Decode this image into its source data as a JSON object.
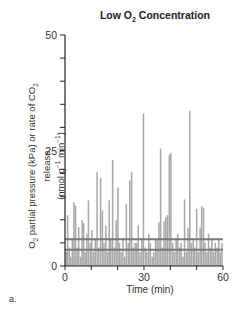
{
  "chart_data": {
    "type": "bar",
    "title": "Low O2 Concentration",
    "title_parts": {
      "pre": "Low O",
      "sub": "2",
      "post": " Concentration"
    },
    "xlabel": "Time (min)",
    "ylabel": "O2 partial pressure (kPa) or rate of CO2 release (nmol g-1 min-1)",
    "ylabel_parts": {
      "line1_pre": "O",
      "line1_sub1": "2",
      "line1_mid": " partial pressure (kPa) or rate of CO",
      "line1_sub2": "2",
      "line1_post": " release",
      "line2_pre": "(nmol g",
      "line2_sup1": "−1",
      "line2_mid": " min",
      "line2_sup2": "−1",
      "line2_post": ")"
    },
    "xlim": [
      0,
      60
    ],
    "ylim": [
      0,
      50
    ],
    "xticks_labeled": [
      0,
      30,
      60
    ],
    "xticks_minor": [
      10,
      20,
      40,
      50
    ],
    "yticks_labeled": [
      0,
      25,
      50
    ],
    "yticks_minor": [
      5,
      10,
      15,
      20,
      30,
      35,
      40,
      45
    ],
    "grid": false,
    "panel_label": "a.",
    "series": [
      {
        "name": "CO2 release rate",
        "color": "#a9a9a9",
        "x": [
          0.5,
          1.0,
          1.6,
          2.2,
          2.8,
          3.4,
          4.0,
          4.6,
          5.2,
          5.9,
          6.5,
          7.1,
          7.7,
          8.3,
          8.9,
          9.6,
          10.2,
          10.9,
          11.5,
          12.2,
          12.8,
          13.5,
          14.2,
          14.8,
          15.5,
          16.2,
          16.8,
          17.4,
          18.1,
          18.8,
          19.4,
          20.1,
          20.7,
          21.3,
          22.0,
          22.7,
          23.3,
          24.0,
          24.6,
          25.3,
          25.9,
          26.6,
          27.2,
          27.8,
          28.5,
          29.2,
          29.8,
          30.5,
          31.1,
          31.8,
          32.4,
          33.1,
          33.7,
          34.4,
          35.0,
          35.7,
          36.3,
          37.0,
          37.6,
          38.3,
          38.9,
          39.6,
          40.2,
          40.9,
          41.5,
          42.2,
          42.8,
          43.5,
          44.1,
          44.8,
          45.4,
          46.1,
          46.7,
          47.4,
          48.0,
          48.7,
          49.3,
          50.0,
          50.6,
          51.3,
          51.9,
          52.6,
          53.2,
          53.9,
          54.5,
          55.2,
          55.8,
          56.5,
          57.1,
          57.8,
          58.4,
          59.0,
          59.6
        ],
        "values": [
          3,
          11,
          4,
          2,
          6,
          13.8,
          13.1,
          4,
          8.4,
          2,
          9.9,
          9.3,
          3,
          7,
          14.2,
          5,
          7.8,
          3,
          6,
          20.3,
          4,
          19,
          12,
          5,
          8.8,
          3,
          14.2,
          6,
          23,
          4,
          9.9,
          17,
          5,
          3,
          6,
          2,
          13.4,
          5,
          18.5,
          20.3,
          4,
          5,
          5,
          8.8,
          3,
          6,
          33,
          4,
          3,
          7,
          5,
          2,
          3,
          6,
          5.6,
          9.5,
          25.4,
          4,
          9.7,
          10.5,
          11,
          24.1,
          24.5,
          5,
          3,
          6,
          7,
          4,
          5,
          2,
          14.4,
          3,
          8.2,
          33.6,
          5,
          6,
          4,
          12.4,
          3,
          8.3,
          12.9,
          12.6,
          5,
          3,
          7,
          4,
          6,
          3,
          5,
          4,
          6,
          3,
          5
        ]
      },
      {
        "name": "O2 partial pressure (upper line)",
        "color": "#7a7a7a",
        "type": "line",
        "x": [
          0,
          60
        ],
        "values": [
          5.8,
          5.8
        ]
      },
      {
        "name": "O2 partial pressure (lower line)",
        "color": "#7a7a7a",
        "type": "line",
        "x": [
          0,
          60
        ],
        "values": [
          3.5,
          3.5
        ]
      }
    ]
  }
}
